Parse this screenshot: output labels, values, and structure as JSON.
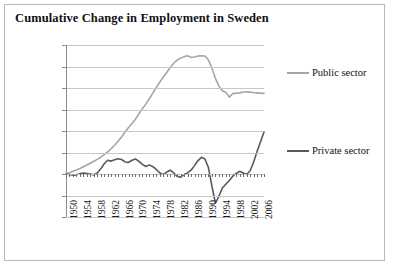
{
  "chart_data": {
    "type": "line",
    "title": "Cumulative Change in Employment in Sweden",
    "xlabel": "",
    "ylabel": "",
    "xlim": [
      1950,
      2007
    ],
    "ylim": [
      -400000,
      1200000
    ],
    "grid": true,
    "legend_position": "right",
    "ytick_labels": [
      "1200000",
      "1000000",
      "800000",
      "600000",
      "400000",
      "200000",
      "0",
      "-200000",
      "-400000"
    ],
    "ytick_values": [
      1200000,
      1000000,
      800000,
      600000,
      400000,
      200000,
      0,
      -200000,
      -400000
    ],
    "xtick_labels": [
      "1950",
      "1954",
      "1958",
      "1962",
      "1966",
      "1970",
      "1974",
      "1978",
      "1982",
      "1986",
      "1990",
      "1994",
      "1998",
      "2002",
      "2006"
    ],
    "xtick_values": [
      1950,
      1954,
      1958,
      1962,
      1966,
      1970,
      1974,
      1978,
      1982,
      1986,
      1990,
      1994,
      1998,
      2002,
      2006
    ],
    "x": [
      1950,
      1951,
      1952,
      1953,
      1954,
      1955,
      1956,
      1957,
      1958,
      1959,
      1960,
      1961,
      1962,
      1963,
      1964,
      1965,
      1966,
      1967,
      1968,
      1969,
      1970,
      1971,
      1972,
      1973,
      1974,
      1975,
      1976,
      1977,
      1978,
      1979,
      1980,
      1981,
      1982,
      1983,
      1984,
      1985,
      1986,
      1987,
      1988,
      1989,
      1990,
      1991,
      1992,
      1993,
      1994,
      1995,
      1996,
      1997,
      1998,
      1999,
      2000,
      2001,
      2002,
      2003,
      2004,
      2005,
      2006,
      2007
    ],
    "series": [
      {
        "name": "Public sector",
        "color": "#a6a6a6",
        "values": [
          0,
          12000,
          25000,
          38000,
          52000,
          68000,
          84000,
          100000,
          118000,
          136000,
          156000,
          180000,
          205000,
          235000,
          268000,
          305000,
          345000,
          390000,
          432000,
          470000,
          510000,
          560000,
          608000,
          652000,
          700000,
          752000,
          805000,
          855000,
          900000,
          945000,
          990000,
          1030000,
          1060000,
          1078000,
          1092000,
          1100000,
          1085000,
          1088000,
          1098000,
          1100000,
          1098000,
          1060000,
          985000,
          890000,
          820000,
          775000,
          760000,
          715000,
          748000,
          752000,
          755000,
          760000,
          765000,
          762000,
          758000,
          755000,
          752000,
          750000
        ]
      },
      {
        "name": "Private sector",
        "color": "#595959",
        "values": [
          0,
          -5000,
          -12000,
          -8000,
          2000,
          10000,
          5000,
          0,
          -8000,
          10000,
          48000,
          95000,
          128000,
          120000,
          132000,
          142000,
          135000,
          112000,
          108000,
          128000,
          140000,
          118000,
          90000,
          70000,
          85000,
          68000,
          42000,
          10000,
          -5000,
          18000,
          35000,
          10000,
          -22000,
          -30000,
          -5000,
          10000,
          35000,
          78000,
          125000,
          155000,
          140000,
          60000,
          -110000,
          -270000,
          -210000,
          -130000,
          -95000,
          -60000,
          -20000,
          5000,
          25000,
          10000,
          -5000,
          30000,
          110000,
          210000,
          300000,
          390000
        ]
      }
    ]
  }
}
